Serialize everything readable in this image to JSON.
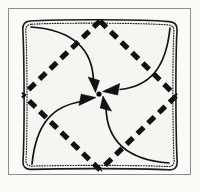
{
  "figure": {
    "canvas": {
      "width": 200,
      "height": 192
    },
    "page_background": "#fbfaf7",
    "frame": {
      "label": "figure-border",
      "x": 8,
      "y": 8,
      "width": 183,
      "height": 167,
      "stroke": "#8c8c8c",
      "stroke_width": 1,
      "fill": "#fbfaf7"
    },
    "paper": {
      "label": "paper-sheet",
      "fill": "#f6f5f2",
      "edge_stroke": "#1a1a1a",
      "edge_stroke_width": 1.6,
      "stipple_stroke": "#222222",
      "corners": [
        {
          "name": "top-left",
          "x": 23,
          "y": 21
        },
        {
          "name": "top-right",
          "x": 176,
          "y": 22
        },
        {
          "name": "bottom-right",
          "x": 177,
          "y": 170
        },
        {
          "name": "bottom-left",
          "x": 24,
          "y": 169
        }
      ],
      "corner_radius": 7
    },
    "fold_lines": {
      "label": "diamond-fold-lines",
      "style": "dashed",
      "stroke": "#111111",
      "stroke_width": 5.2,
      "dash_pattern": "9 6",
      "vertices": [
        {
          "name": "top-midpoint",
          "x": 100,
          "y": 21
        },
        {
          "name": "right-midpoint",
          "x": 176,
          "y": 96
        },
        {
          "name": "bottom-midpoint",
          "x": 100,
          "y": 170
        },
        {
          "name": "left-midpoint",
          "x": 23,
          "y": 95
        }
      ]
    },
    "center_point": {
      "label": "center-dot",
      "x": 99,
      "y": 94,
      "radius": 2.6,
      "fill": "#000000"
    },
    "arrows": {
      "label": "fold-direction-arrows",
      "count": 4,
      "stroke": "#111111",
      "stroke_width": 1.7,
      "head_fill": "#111111",
      "items": [
        {
          "name": "arrow-from-top-left",
          "from_corner": "top-left",
          "start": {
            "x": 31,
            "y": 27
          },
          "control": {
            "x": 92,
            "y": 36
          },
          "end": {
            "x": 93,
            "y": 88
          },
          "head_angle_deg": 80
        },
        {
          "name": "arrow-from-top-right",
          "from_corner": "top-right",
          "start": {
            "x": 170,
            "y": 28
          },
          "control": {
            "x": 160,
            "y": 86
          },
          "end": {
            "x": 108,
            "y": 92
          },
          "head_angle_deg": 188
        },
        {
          "name": "arrow-from-bottom-left",
          "from_corner": "bottom-left",
          "start": {
            "x": 32,
            "y": 164
          },
          "control": {
            "x": 40,
            "y": 106
          },
          "end": {
            "x": 90,
            "y": 100
          },
          "head_angle_deg": 352
        },
        {
          "name": "arrow-from-bottom-right",
          "from_corner": "bottom-right",
          "start": {
            "x": 169,
            "y": 163
          },
          "control": {
            "x": 110,
            "y": 154
          },
          "end": {
            "x": 104,
            "y": 101
          },
          "head_angle_deg": 262
        }
      ]
    }
  }
}
